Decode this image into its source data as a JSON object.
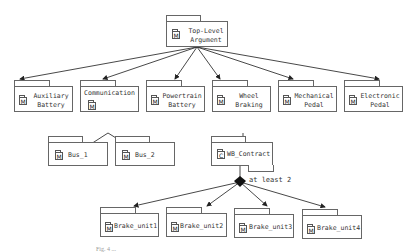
{
  "diagram": {
    "root": {
      "label_line1": "Top-Level",
      "label_line2": "Argument",
      "icon": "M"
    },
    "level1": [
      {
        "label_line1": "Auxiliary",
        "label_line2": "Battery",
        "icon": "M"
      },
      {
        "label_line1": "Communication",
        "label_line2": "",
        "icon": "M"
      },
      {
        "label_line1": "Powertrain",
        "label_line2": "Battery",
        "icon": "M"
      },
      {
        "label_line1": "Wheel",
        "label_line2": "Braking",
        "icon": "M"
      },
      {
        "label_line1": "Mechanical",
        "label_line2": "Pedal",
        "icon": "M"
      },
      {
        "label_line1": "Electronic",
        "label_line2": "Pedal",
        "icon": "M"
      }
    ],
    "communication_children": [
      {
        "label": "Bus_1",
        "icon": "M"
      },
      {
        "label": "Bus_2",
        "icon": "M"
      }
    ],
    "contract": {
      "label": "WB_Contract",
      "icon": "C"
    },
    "multiplicity_note": "at least 2",
    "brake_units": [
      {
        "label": "Brake_unit1",
        "icon": "M"
      },
      {
        "label": "Brake_unit2",
        "icon": "M"
      },
      {
        "label": "Brake_unit3",
        "icon": "M"
      },
      {
        "label": "Brake_unit4",
        "icon": "M"
      }
    ],
    "caption": "Fig. 4 ..."
  }
}
